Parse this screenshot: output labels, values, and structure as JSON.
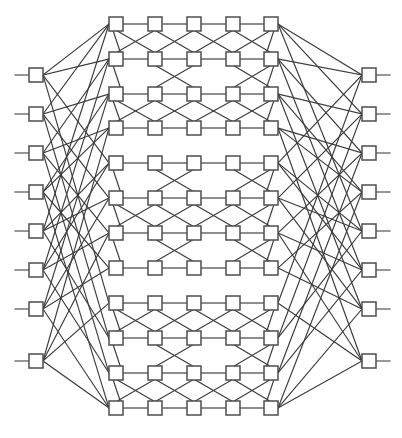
{
  "diagram": {
    "kind": "graph-drawing",
    "background_color": "#ffffff",
    "node_fill_color": "#ffffff",
    "node_stroke_color": "#4d4d4d",
    "edge_color": "#3b3b3b",
    "node_width": 14,
    "node_height": 14,
    "node_stroke_width": 1.5,
    "edge_stroke_width": 1.15,
    "canvas": {
      "width": 402,
      "height": 438
    },
    "counts": {
      "left_terminal_nodes": 8,
      "right_terminal_nodes": 8,
      "mesh_rows": 12,
      "mesh_columns": 5,
      "mesh_nodes": 60,
      "total_nodes": 76
    },
    "columns": {
      "left_terminal_x": 36,
      "mesh_x": [
        116,
        155,
        194,
        233,
        271
      ],
      "right_terminal_x": 369
    },
    "left_terminal_y": [
      75,
      114,
      153,
      192,
      231,
      270,
      309,
      361
    ],
    "right_terminal_y": [
      75,
      114,
      153,
      192,
      231,
      270,
      309,
      361
    ],
    "mesh_row_y": [
      24,
      59,
      94,
      128,
      163,
      198,
      233,
      268,
      303,
      338,
      373,
      408
    ],
    "mesh_groups": [
      {
        "name": "group-top",
        "rows": [
          0,
          1,
          2,
          3
        ]
      },
      {
        "name": "group-middle",
        "rows": [
          4,
          5,
          6,
          7
        ]
      },
      {
        "name": "group-bottom",
        "rows": [
          8,
          9,
          10,
          11
        ]
      }
    ],
    "stub_length": 14,
    "labels": {
      "left_column": "left terminal column",
      "right_column": "right terminal column",
      "mesh": "interconnect mesh"
    }
  },
  "chart_data": {
    "type": "diagram",
    "nodes": {
      "left": [
        {
          "id": "L0",
          "x": 36,
          "y": 75
        },
        {
          "id": "L1",
          "x": 36,
          "y": 114
        },
        {
          "id": "L2",
          "x": 36,
          "y": 153
        },
        {
          "id": "L3",
          "x": 36,
          "y": 192
        },
        {
          "id": "L4",
          "x": 36,
          "y": 231
        },
        {
          "id": "L5",
          "x": 36,
          "y": 270
        },
        {
          "id": "L6",
          "x": 36,
          "y": 309
        },
        {
          "id": "L7",
          "x": 36,
          "y": 361
        }
      ],
      "right": [
        {
          "id": "R0",
          "x": 369,
          "y": 75
        },
        {
          "id": "R1",
          "x": 369,
          "y": 114
        },
        {
          "id": "R2",
          "x": 369,
          "y": 153
        },
        {
          "id": "R3",
          "x": 369,
          "y": 192
        },
        {
          "id": "R4",
          "x": 369,
          "y": 231
        },
        {
          "id": "R5",
          "x": 369,
          "y": 270
        },
        {
          "id": "R6",
          "x": 369,
          "y": 309
        },
        {
          "id": "R7",
          "x": 369,
          "y": 361
        }
      ],
      "mesh_rows": [
        {
          "row": 0,
          "y": 24,
          "xs": [
            116,
            155,
            194,
            233,
            271
          ]
        },
        {
          "row": 1,
          "y": 59,
          "xs": [
            116,
            155,
            194,
            233,
            271
          ]
        },
        {
          "row": 2,
          "y": 94,
          "xs": [
            116,
            155,
            194,
            233,
            271
          ]
        },
        {
          "row": 3,
          "y": 128,
          "xs": [
            116,
            155,
            194,
            233,
            271
          ]
        },
        {
          "row": 4,
          "y": 163,
          "xs": [
            116,
            155,
            194,
            233,
            271
          ]
        },
        {
          "row": 5,
          "y": 198,
          "xs": [
            116,
            155,
            194,
            233,
            271
          ]
        },
        {
          "row": 6,
          "y": 233,
          "xs": [
            116,
            155,
            194,
            233,
            271
          ]
        },
        {
          "row": 7,
          "y": 268,
          "xs": [
            116,
            155,
            194,
            233,
            271
          ]
        },
        {
          "row": 8,
          "y": 303,
          "xs": [
            116,
            155,
            194,
            233,
            271
          ]
        },
        {
          "row": 9,
          "y": 338,
          "xs": [
            116,
            155,
            194,
            233,
            271
          ]
        },
        {
          "row": 10,
          "y": 373,
          "xs": [
            116,
            155,
            194,
            233,
            271
          ]
        },
        {
          "row": 11,
          "y": 408,
          "xs": [
            116,
            155,
            194,
            233,
            271
          ]
        }
      ]
    },
    "edge_rules": {
      "horizontal_row_chains": true,
      "adjacent_row_crossbars": [
        [
          0,
          1
        ],
        [
          1,
          2
        ],
        [
          2,
          3
        ],
        [
          4,
          5
        ],
        [
          5,
          6
        ],
        [
          6,
          7
        ],
        [
          8,
          9
        ],
        [
          9,
          10
        ],
        [
          10,
          11
        ]
      ],
      "crossbar_column_pairs": [
        [
          0,
          1
        ],
        [
          1,
          2
        ],
        [
          2,
          3
        ],
        [
          3,
          4
        ]
      ],
      "left_fanout_targets_column": 0,
      "right_fanout_targets_column": 4
    },
    "left_edges": [
      [
        0,
        0
      ],
      [
        0,
        1
      ],
      [
        0,
        4
      ],
      [
        0,
        8
      ],
      [
        1,
        0
      ],
      [
        1,
        2
      ],
      [
        1,
        5
      ],
      [
        1,
        9
      ],
      [
        2,
        1
      ],
      [
        2,
        3
      ],
      [
        2,
        6
      ],
      [
        2,
        10
      ],
      [
        3,
        2
      ],
      [
        3,
        3
      ],
      [
        3,
        7
      ],
      [
        3,
        11
      ],
      [
        4,
        0
      ],
      [
        4,
        4
      ],
      [
        4,
        5
      ],
      [
        4,
        9
      ],
      [
        5,
        1
      ],
      [
        5,
        4
      ],
      [
        5,
        6
      ],
      [
        5,
        10
      ],
      [
        6,
        2
      ],
      [
        6,
        5
      ],
      [
        6,
        7
      ],
      [
        6,
        11
      ],
      [
        7,
        3
      ],
      [
        7,
        6
      ],
      [
        7,
        8
      ],
      [
        7,
        11
      ]
    ],
    "right_edges": [
      [
        0,
        0
      ],
      [
        0,
        1
      ],
      [
        0,
        4
      ],
      [
        0,
        8
      ],
      [
        1,
        0
      ],
      [
        1,
        2
      ],
      [
        1,
        5
      ],
      [
        1,
        9
      ],
      [
        2,
        1
      ],
      [
        2,
        3
      ],
      [
        2,
        6
      ],
      [
        2,
        10
      ],
      [
        3,
        2
      ],
      [
        3,
        3
      ],
      [
        3,
        7
      ],
      [
        3,
        11
      ],
      [
        4,
        0
      ],
      [
        4,
        4
      ],
      [
        4,
        5
      ],
      [
        4,
        9
      ],
      [
        5,
        1
      ],
      [
        5,
        4
      ],
      [
        5,
        6
      ],
      [
        5,
        10
      ],
      [
        6,
        2
      ],
      [
        6,
        5
      ],
      [
        6,
        7
      ],
      [
        6,
        11
      ],
      [
        7,
        3
      ],
      [
        7,
        6
      ],
      [
        7,
        8
      ],
      [
        7,
        11
      ]
    ]
  }
}
